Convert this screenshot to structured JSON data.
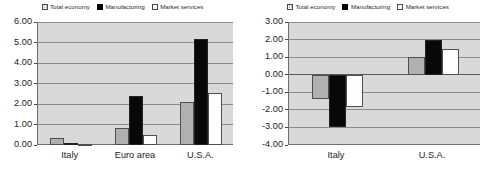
{
  "legend": {
    "items": [
      {
        "label": "Total economy",
        "swatch": "gray-hatched-swatch-icon",
        "color": "#b0b0b0"
      },
      {
        "label": "Manufacturing",
        "swatch": "black-swatch-icon",
        "color": "#000000"
      },
      {
        "label": "Market services",
        "swatch": "white-swatch-icon",
        "color": "#ffffff"
      }
    ]
  },
  "chart_data": [
    {
      "id": "left",
      "type": "bar",
      "title": "",
      "subtitle": "",
      "xlabel": "",
      "ylabel": "",
      "categories": [
        "Italy",
        "Euro area",
        "U.S.A."
      ],
      "series": [
        {
          "name": "Total economy",
          "values": [
            0.35,
            0.85,
            2.1
          ]
        },
        {
          "name": "Manufacturing",
          "values": [
            0.12,
            2.4,
            5.15
          ]
        },
        {
          "name": "Market services",
          "values": [
            0.05,
            0.5,
            2.55
          ]
        }
      ],
      "ylim": [
        0.0,
        6.0
      ],
      "ytick_step": 1.0,
      "ytick_labels": [
        "6.00",
        "5.00",
        "4.00",
        "3.00",
        "2.00",
        "1.00",
        "0.00"
      ],
      "ytick_values": [
        6.0,
        5.0,
        4.0,
        3.0,
        2.0,
        1.0,
        0.0
      ],
      "grid": true,
      "legend_position": "top"
    },
    {
      "id": "right",
      "type": "bar",
      "title": "",
      "subtitle": "",
      "xlabel": "",
      "ylabel": "",
      "categories": [
        "Italy",
        "U.S.A."
      ],
      "series": [
        {
          "name": "Total economy",
          "values": [
            -1.4,
            1.0
          ]
        },
        {
          "name": "Manufacturing",
          "values": [
            -2.95,
            2.0
          ]
        },
        {
          "name": "Market services",
          "values": [
            -1.85,
            1.45
          ]
        }
      ],
      "ylim": [
        -4.0,
        3.0
      ],
      "ytick_step": 1.0,
      "ytick_labels": [
        "3.00",
        "2.00",
        "1.00",
        "0.00",
        "-1.00",
        "-2.00",
        "-3.00",
        "-4.00"
      ],
      "ytick_values": [
        3.0,
        2.0,
        1.0,
        0.0,
        -1.0,
        -2.0,
        -3.0,
        -4.0
      ],
      "grid": true,
      "legend_position": "top"
    }
  ]
}
